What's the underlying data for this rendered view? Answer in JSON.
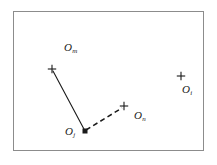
{
  "figure": {
    "title": "",
    "background_color": "#ffffff",
    "border_color": "#8c8c8c",
    "marker_color": "#1a1a1a",
    "line_color": "#1a1a1a"
  },
  "chart_data": {
    "type": "scatter",
    "title": "",
    "xlabel": "",
    "ylabel": "",
    "grid": false,
    "legend": null,
    "axis_visible": false,
    "xlim": [
      13,
      204
    ],
    "ylim": [
      11,
      151
    ],
    "points": [
      {
        "id": "Om",
        "label_base": "O",
        "label_sub": "m",
        "marker": "plus",
        "x": 52,
        "y": 69,
        "label_x": 64,
        "label_y": 42
      },
      {
        "id": "Oi",
        "label_base": "O",
        "label_sub": "i",
        "marker": "plus",
        "x": 181,
        "y": 76,
        "label_x": 182,
        "label_y": 84
      },
      {
        "id": "Oj",
        "label_base": "O",
        "label_sub": "j",
        "marker": "square",
        "x": 85,
        "y": 131,
        "label_x": 65,
        "label_y": 126
      },
      {
        "id": "On",
        "label_base": "O",
        "label_sub": "n",
        "marker": "plus",
        "x": 124,
        "y": 106,
        "label_x": 134,
        "label_y": 110
      }
    ],
    "connections": [
      {
        "id": "Oj-to-Om",
        "from": "Oj",
        "to": "Om",
        "style": "solid",
        "x1": 85,
        "y1": 131,
        "x2": 53,
        "y2": 71
      },
      {
        "id": "Oj-to-On",
        "from": "Oj",
        "to": "On",
        "style": "dashed",
        "x1": 86,
        "y1": 130,
        "x2": 122,
        "y2": 108
      }
    ]
  }
}
